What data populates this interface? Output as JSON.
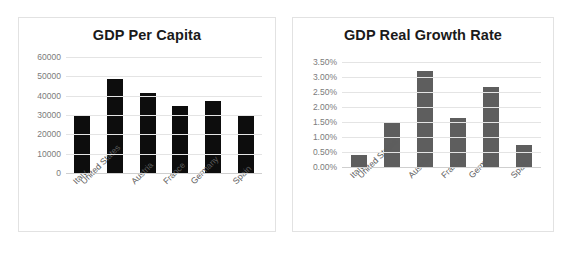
{
  "charts": [
    {
      "id": "gdp-per-capita",
      "title": "GDP Per Capita",
      "bar_color": "#0d0d0d",
      "grid_color": "#e4e4e4",
      "tick_color": "#7b7b7b",
      "yticks": [
        "60000",
        "50000",
        "40000",
        "30000",
        "20000",
        "10000",
        "0"
      ],
      "categories": [
        "Italy",
        "United States",
        "Austria",
        "France",
        "Germany",
        "Spain"
      ]
    },
    {
      "id": "gdp-real-growth-rate",
      "title": "GDP Real Growth Rate",
      "bar_color": "#5e5e5e",
      "grid_color": "#e4e4e4",
      "tick_color": "#7b7b7b",
      "yticks": [
        "3.50%",
        "3.00%",
        "2.50%",
        "2.00%",
        "1.50%",
        "1.00%",
        "0.50%",
        "0.00%"
      ],
      "categories": [
        "Italy",
        "United States",
        "Austria",
        "France",
        "Germany",
        "Spain"
      ]
    }
  ],
  "chart_data": [
    {
      "type": "bar",
      "title": "GDP Per Capita",
      "xlabel": "",
      "ylabel": "",
      "categories": [
        "Italy",
        "United States",
        "Austria",
        "France",
        "Germany",
        "Spain"
      ],
      "values": [
        29600,
        48500,
        41300,
        34700,
        37300,
        29900
      ],
      "ylim": [
        0,
        60000
      ],
      "ytick_values": [
        0,
        10000,
        20000,
        30000,
        40000,
        50000,
        60000
      ],
      "ytick_labels": [
        "0",
        "10000",
        "20000",
        "30000",
        "40000",
        "50000",
        "60000"
      ],
      "grid": true,
      "legend": false,
      "bar_color": "#0d0d0d"
    },
    {
      "type": "bar",
      "title": "GDP Real Growth Rate",
      "xlabel": "",
      "ylabel": "",
      "categories": [
        "Italy",
        "United States",
        "Austria",
        "France",
        "Germany",
        "Spain"
      ],
      "values": [
        0.41,
        1.5,
        3.2,
        1.65,
        2.68,
        0.72
      ],
      "value_unit": "percent",
      "ylim": [
        0,
        3.5
      ],
      "ytick_values": [
        0.0,
        0.5,
        1.0,
        1.5,
        2.0,
        2.5,
        3.0,
        3.5
      ],
      "ytick_labels": [
        "0.00%",
        "0.50%",
        "1.00%",
        "1.50%",
        "2.00%",
        "2.50%",
        "3.00%",
        "3.50%"
      ],
      "grid": true,
      "legend": false,
      "bar_color": "#5e5e5e"
    }
  ]
}
